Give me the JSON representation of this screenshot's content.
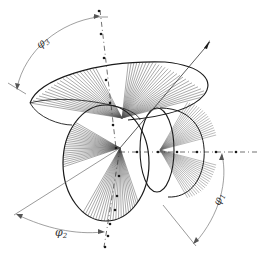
{
  "diagram": {
    "colors": {
      "ink": "#1a1a1a",
      "axis": "#333333",
      "arc": "#777777",
      "hatch": "#555555"
    },
    "labels": {
      "phi1": {
        "symbol": "φ",
        "subscript": "1"
      },
      "phi2": {
        "symbol": "φ",
        "subscript": "2"
      },
      "phi3": {
        "symbol": "φ",
        "subscript": "3"
      }
    }
  }
}
